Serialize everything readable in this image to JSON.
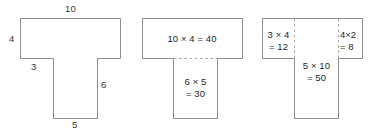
{
  "figures": [
    {
      "name": "t-shape-with-side-lengths",
      "labels": [
        {
          "name": "top-width-label",
          "text": "10"
        },
        {
          "name": "left-height-label",
          "text": "4"
        },
        {
          "name": "left-shoulder-label",
          "text": "3"
        },
        {
          "name": "right-stem-height-label",
          "text": "6"
        },
        {
          "name": "bottom-width-label",
          "text": "5"
        }
      ]
    },
    {
      "name": "t-shape-split-into-two-rectangles",
      "labels": [
        {
          "name": "top-rectangle-area-label",
          "line1": "10 × 4 = 40",
          "line2": ""
        },
        {
          "name": "bottom-rectangle-area-label",
          "line1": "6 × 5",
          "line2": "= 30"
        }
      ]
    },
    {
      "name": "t-shape-split-into-three-rectangles",
      "labels": [
        {
          "name": "left-rectangle-area-label",
          "line1": "3 × 4",
          "line2": "= 12"
        },
        {
          "name": "center-rectangle-area-label",
          "line1": "5 × 10",
          "line2": "= 50"
        },
        {
          "name": "right-rectangle-area-label",
          "line1": "4×2",
          "line2": "= 8"
        }
      ]
    }
  ],
  "colors": {
    "background": "#ffffff",
    "outline": "#8e8e8e",
    "dashed": "#a8a8a8",
    "text": "#1f1f1f",
    "dimension_text": "#3a3a3a"
  }
}
